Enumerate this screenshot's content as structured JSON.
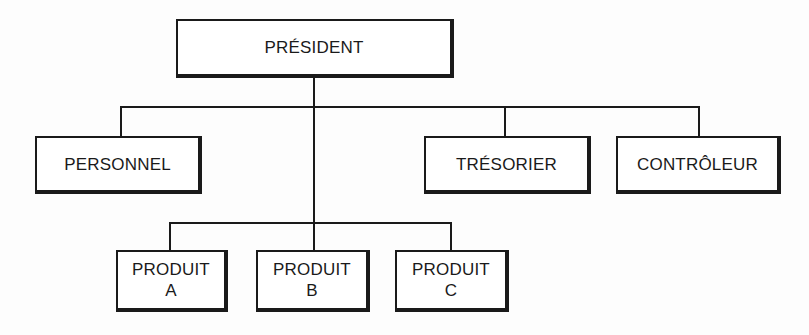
{
  "diagram": {
    "type": "org-chart",
    "colors": {
      "line": "#1a1a1a",
      "box_fill": "#ffffff",
      "text": "#1a1a1a"
    },
    "root": {
      "label": "PRÉSIDENT"
    },
    "staff": [
      {
        "label": "PERSONNEL"
      },
      {
        "label": "TRÉSORIER"
      },
      {
        "label": "CONTRÔLEUR"
      }
    ],
    "products": [
      {
        "line1": "PRODUIT",
        "line2": "A"
      },
      {
        "line1": "PRODUIT",
        "line2": "B"
      },
      {
        "line1": "PRODUIT",
        "line2": "C"
      }
    ]
  }
}
